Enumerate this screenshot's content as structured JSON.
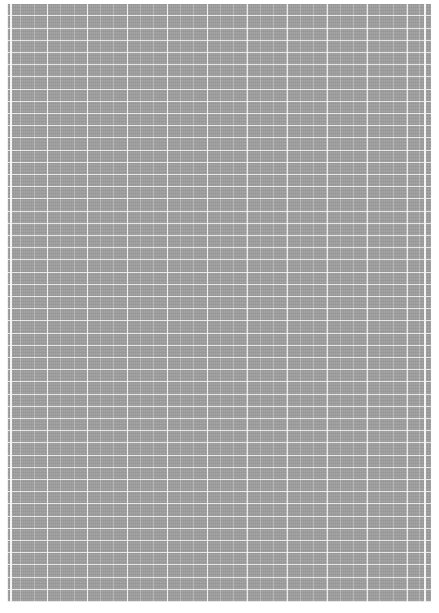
{
  "page": {
    "colors": {
      "paper": "#a3a3a3",
      "grid_line": "#ffffff",
      "background": "#ffffff"
    }
  }
}
